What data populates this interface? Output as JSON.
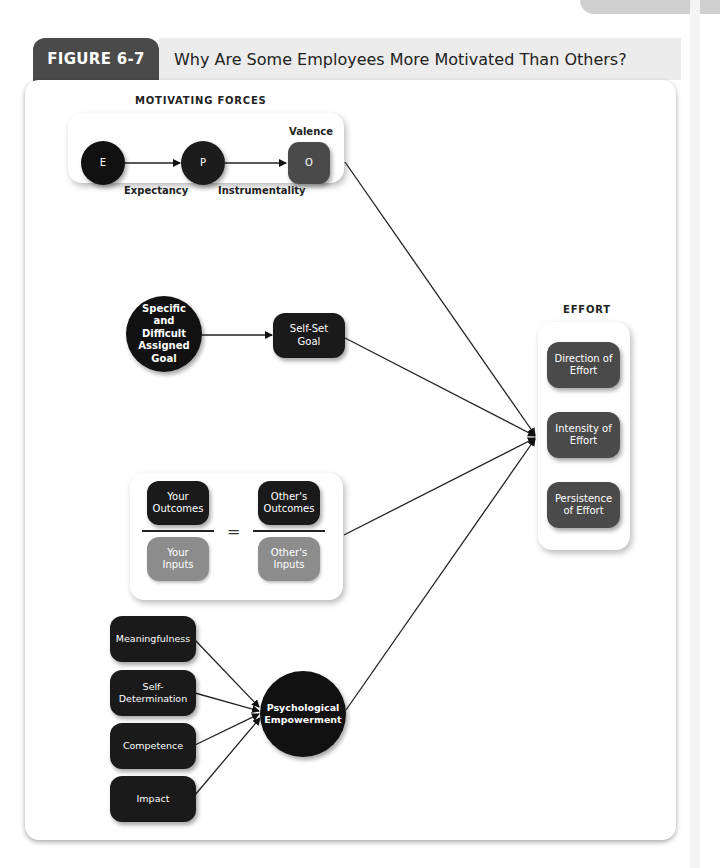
{
  "figure": {
    "number_label": "FIGURE 6-7",
    "title": "Why Are Some Employees More Motivated Than Others?"
  },
  "motivating_forces": {
    "section_label": "MOTIVATING FORCES",
    "nodes": {
      "e": "E",
      "p": "P",
      "o": "O"
    },
    "labels": {
      "expectancy": "Expectancy",
      "instrumentality": "Instrumentality",
      "valence": "Valence"
    }
  },
  "goal_setting": {
    "assigned_goal": "Specific and Difficult Assigned Goal",
    "self_set_goal": "Self-Set Goal"
  },
  "equity": {
    "your_outcomes": "Your Outcomes",
    "your_inputs": "Your Inputs",
    "equals": "=",
    "others_outcomes": "Other's Outcomes",
    "others_inputs": "Other's Inputs"
  },
  "empowerment": {
    "factors": [
      "Meaningfulness",
      "Self-Determination",
      "Competence",
      "Impact"
    ],
    "center": "Psychological Empowerment"
  },
  "effort": {
    "section_label": "EFFORT",
    "items": [
      "Direction of Effort",
      "Intensity of Effort",
      "Persistence of Effort"
    ]
  },
  "colors": {
    "tab_dark": "#4a4a4a",
    "title_bar": "#ececec",
    "node_black": "#111111",
    "node_dark_gray": "#4a4a4a",
    "node_light_gray": "#8c8c8c"
  }
}
